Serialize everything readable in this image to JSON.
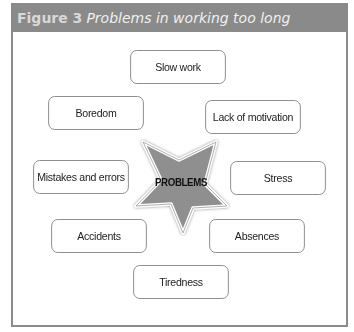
{
  "figure": {
    "number": "Figure 3",
    "title": "Problems in working too long"
  },
  "center": {
    "label": "PROBLEMS",
    "shape": "star-icon",
    "fill": "#8f8f8f"
  },
  "items": [
    {
      "label": "Slow work"
    },
    {
      "label": "Boredom"
    },
    {
      "label": "Lack of motivation"
    },
    {
      "label": "Mistakes and errors"
    },
    {
      "label": "Stress"
    },
    {
      "label": "Accidents"
    },
    {
      "label": "Absences"
    },
    {
      "label": "Tiredness"
    }
  ],
  "colors": {
    "header": "#8a8a8a",
    "border": "#8c8c8c"
  }
}
